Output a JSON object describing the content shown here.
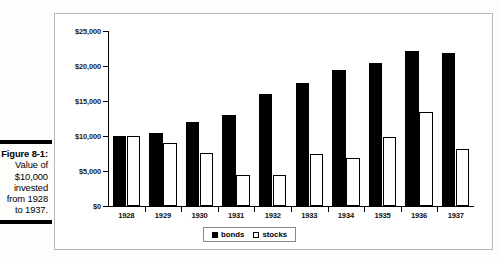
{
  "figure": {
    "caption_title": "Figure 8-1:",
    "caption_lines": [
      "Value of",
      "$10,000",
      "invested",
      "from 1928",
      "to 1937."
    ]
  },
  "legend": {
    "position": "bottom-center",
    "items": [
      {
        "label": "bonds",
        "swatch": "filled-square-icon",
        "color": "#000000"
      },
      {
        "label": "stocks",
        "swatch": "open-square-icon",
        "color": "#ffffff"
      }
    ]
  },
  "axis": {
    "y_ticks": [
      "$0",
      "$5,000",
      "$10,000",
      "$15,000",
      "$20,000",
      "$25,000"
    ],
    "y_tick_values": [
      0,
      5000,
      10000,
      15000,
      20000,
      25000
    ]
  },
  "chart_data": {
    "type": "bar",
    "title": "",
    "xlabel": "",
    "ylabel": "",
    "ylim": [
      0,
      25000
    ],
    "grid": false,
    "legend_position": "bottom-center",
    "categories": [
      "1928",
      "1929",
      "1930",
      "1931",
      "1932",
      "1933",
      "1934",
      "1935",
      "1936",
      "1937"
    ],
    "series": [
      {
        "name": "bonds",
        "color": "#000000",
        "values": [
          10000,
          10400,
          12000,
          13000,
          16000,
          17600,
          19500,
          20500,
          22100,
          21900
        ]
      },
      {
        "name": "stocks",
        "color": "#ffffff",
        "values": [
          10000,
          9000,
          7600,
          4500,
          4500,
          7400,
          6800,
          9900,
          13400,
          8100
        ]
      }
    ],
    "ytick_labels": [
      "$0",
      "$5,000",
      "$10,000",
      "$15,000",
      "$20,000",
      "$25,000"
    ],
    "ytick_values": [
      0,
      5000,
      10000,
      15000,
      20000,
      25000
    ]
  }
}
